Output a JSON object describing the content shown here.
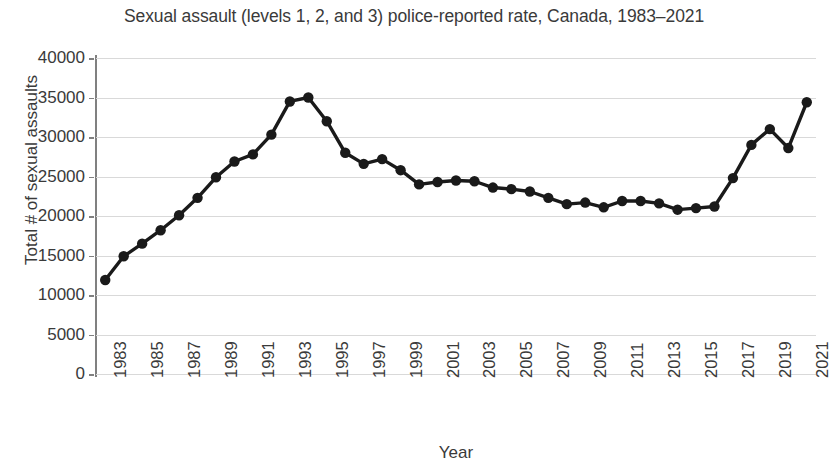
{
  "chart_data": {
    "type": "line",
    "title": "Sexual assault (levels 1, 2, and 3) police-reported rate, Canada, 1983–2021",
    "xlabel": "Year",
    "ylabel": "Total # of sexual assaults",
    "ylim": [
      0,
      40000
    ],
    "y_ticks": [
      0,
      5000,
      10000,
      15000,
      20000,
      25000,
      30000,
      35000,
      40000
    ],
    "y_tick_labels": [
      "0",
      "5000",
      "10000",
      "15000",
      "20000",
      "25000",
      "30000",
      "35000",
      "40000"
    ],
    "x_tick_labels": [
      "1983",
      "1985",
      "1987",
      "1989",
      "1991",
      "1993",
      "1995",
      "1997",
      "1999",
      "2001",
      "2003",
      "2005",
      "2007",
      "2009",
      "2011",
      "2013",
      "2015",
      "2017",
      "2019",
      "2021"
    ],
    "x": [
      1983,
      1984,
      1985,
      1986,
      1987,
      1988,
      1989,
      1990,
      1991,
      1992,
      1993,
      1994,
      1995,
      1996,
      1997,
      1998,
      1999,
      2000,
      2001,
      2002,
      2003,
      2004,
      2005,
      2006,
      2007,
      2008,
      2009,
      2010,
      2011,
      2012,
      2013,
      2014,
      2015,
      2016,
      2017,
      2018,
      2019,
      2020,
      2021
    ],
    "values": [
      11900,
      14900,
      16500,
      18200,
      20100,
      22300,
      24900,
      26900,
      27800,
      30300,
      34500,
      35000,
      32000,
      28000,
      26600,
      27200,
      25800,
      24000,
      24300,
      24500,
      24400,
      23600,
      23400,
      23100,
      22300,
      21500,
      21700,
      21100,
      21900,
      21900,
      21600,
      20800,
      21000,
      21200,
      24800,
      29000,
      31000,
      28600,
      34400
    ],
    "grid": true,
    "gridlines": "horizontal",
    "legend": "none",
    "line_color": "#1a1a1a",
    "marker": "circle"
  }
}
